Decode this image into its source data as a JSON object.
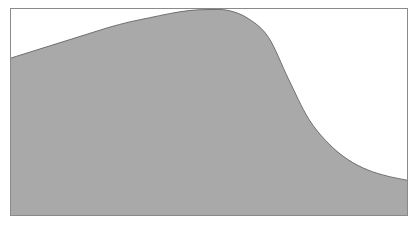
{
  "chart_data": {
    "type": "area",
    "title": "",
    "xlabel": "",
    "ylabel": "",
    "grid": false,
    "legend": null,
    "x": [
      0,
      0.05,
      0.1,
      0.15,
      0.2,
      0.25,
      0.3,
      0.35,
      0.4,
      0.45,
      0.5,
      0.55,
      0.6,
      0.65,
      0.7,
      0.75,
      0.8,
      0.85,
      0.9,
      0.95,
      1.0
    ],
    "values": [
      0.76,
      0.79,
      0.82,
      0.85,
      0.88,
      0.91,
      0.935,
      0.955,
      0.975,
      0.99,
      0.995,
      0.99,
      0.95,
      0.86,
      0.66,
      0.47,
      0.35,
      0.27,
      0.22,
      0.19,
      0.17
    ],
    "xlim": [
      0,
      1
    ],
    "ylim": [
      0,
      1
    ],
    "colors": {
      "fill": "#a9a9a9",
      "line": "#6f6f6f",
      "frame": "#8a8a8a",
      "background": "#ffffff"
    }
  }
}
